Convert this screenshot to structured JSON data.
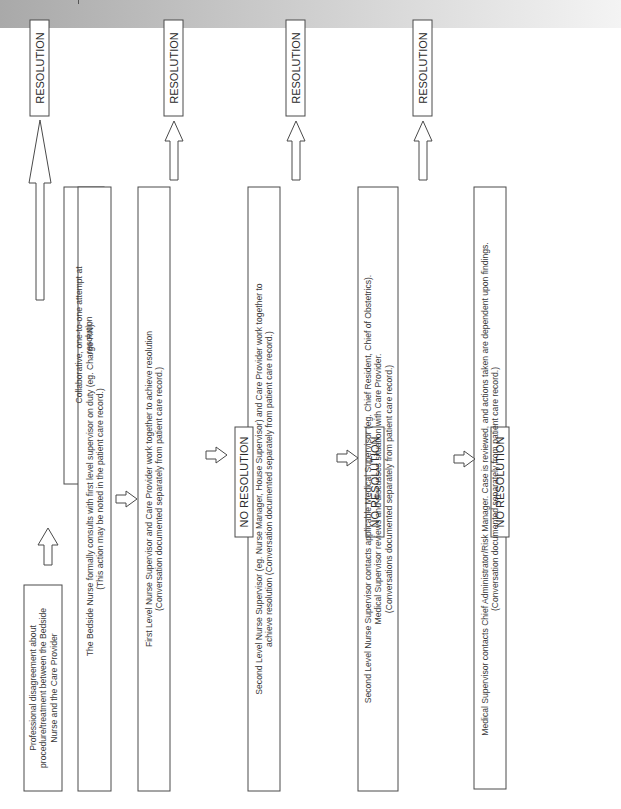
{
  "diagram": {
    "orientation": "rotated-90-counterclockwise",
    "nodes": {
      "start": {
        "lines": [
          "Professional disagreement about",
          "procedure/treatment between the Bedside",
          "Nurse and the Care Provider"
        ]
      },
      "collaborative": {
        "lines": [
          "Collaborative, one-to-one attempt at",
          "resolution"
        ]
      },
      "step1": {
        "lines": [
          "The Bedside Nurse formally consults with first level supervisor on duty (eg. Charge RN).",
          "(This action may be noted in the patient care record.)"
        ]
      },
      "step2": {
        "lines": [
          "First Level Nurse Supervisor and Care Provider work together to achieve resolution",
          "(Conversation documented separately from patient care record.)"
        ]
      },
      "step3": {
        "lines": [
          "Second Level Nurse Supervisor (eg. Nurse Manager, House Supervisor) and Care Provider work together to",
          "achieve resolution (Conversation documented separately from patient care record.)"
        ]
      },
      "step4": {
        "lines": [
          "Second Level Nurse Supervisor contacts applicable Medical Supervisor (eg. Chief Resident, Chief of Obstetrics).",
          "Medical Supervisor reviews and discusses situation with Care Provider.",
          "(Conversations documented separately from patient care record.)"
        ]
      },
      "step5": {
        "lines": [
          "Medical Supervisor contacts Chief Administrator/Risk Manager. Case is reviewed, and actions taken are dependent upon findings.",
          "(Conversation documented separately from patient care record.)"
        ]
      },
      "resolution_1": {
        "label": "RESOLUTION"
      },
      "resolution_2": {
        "label": "RESOLUTION"
      },
      "resolution_3": {
        "label": "RESOLUTION"
      },
      "resolution_4": {
        "label": "RESOLUTION"
      },
      "no_resolution_1": {
        "label": "NO RESOLUTION"
      },
      "no_resolution_2": {
        "label": "NO RESOLUTION"
      },
      "no_resolution_3": {
        "label": "NO RESOLUTION"
      }
    },
    "edges": [
      [
        "start",
        "collaborative"
      ],
      [
        "collaborative",
        "resolution_1"
      ],
      [
        "collaborative",
        "step1"
      ],
      [
        "step1",
        "step2"
      ],
      [
        "step2",
        "resolution_2"
      ],
      [
        "step2",
        "no_resolution_1"
      ],
      [
        "no_resolution_1",
        "step3"
      ],
      [
        "step3",
        "resolution_3"
      ],
      [
        "step3",
        "no_resolution_2"
      ],
      [
        "no_resolution_2",
        "step4"
      ],
      [
        "step4",
        "resolution_4"
      ],
      [
        "step4",
        "no_resolution_3"
      ],
      [
        "no_resolution_3",
        "step5"
      ]
    ],
    "colors": {
      "stroke": "#4a4a4a",
      "text": "#3a3a3a",
      "header_band_start": "#a9a9a9",
      "header_band_end": "#f4f4f4"
    }
  }
}
